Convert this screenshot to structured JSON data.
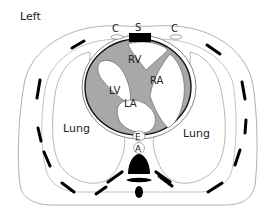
{
  "diagram": {
    "type": "anatomical-cross-section",
    "orientation_label": "Left",
    "labels": {
      "costal_left": "C",
      "sternum": "S",
      "costal_right": "C",
      "right_ventricle": "RV",
      "right_atrium": "RA",
      "left_ventricle": "LV",
      "left_atrium": "LA",
      "esophagus": "E",
      "aorta": "A",
      "lung_left": "Lung",
      "lung_right": "Lung"
    },
    "colors": {
      "outline": "#8a8a8a",
      "bone": "#000000",
      "myocardium": "#a8a8a8",
      "background": "#ffffff"
    }
  }
}
